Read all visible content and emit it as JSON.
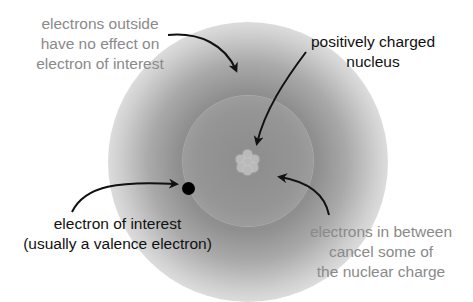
{
  "diagram": {
    "labels": {
      "outside": [
        "electrons outside",
        "have no effect on",
        "electron of interest"
      ],
      "nucleus": [
        "positively charged",
        "nucleus"
      ],
      "electron": [
        "electron of interest",
        "(usually a valence electron)"
      ],
      "between": [
        "electrons in between",
        "cancel some of",
        "the nuclear charge"
      ]
    },
    "colors": {
      "gray_text": "#8a8a8a",
      "dark_text": "#111111",
      "electron": "#000000",
      "arrow": "#111111"
    },
    "elements": [
      "outer electron cloud",
      "inner electron cloud",
      "nucleus",
      "electron of interest"
    ]
  }
}
